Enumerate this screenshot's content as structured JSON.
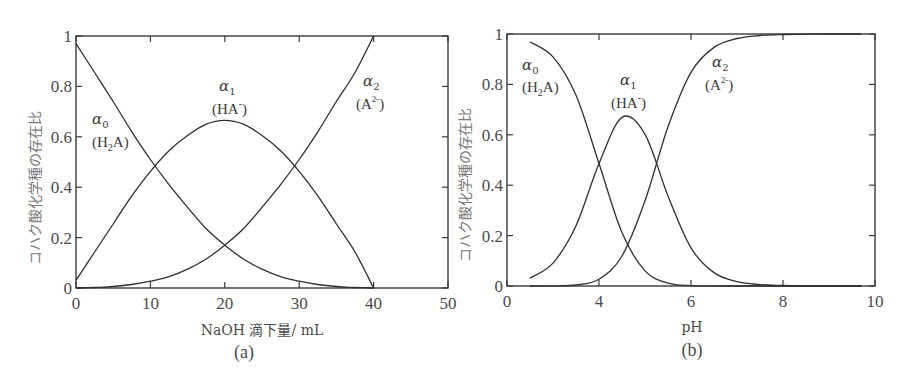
{
  "chart_data": [
    {
      "type": "line",
      "panel": "(a)",
      "title": "",
      "xlabel": "NaOH 滴下量/ mL",
      "ylabel": "コハク酸化学種の存在比",
      "caption": "(a)",
      "xlim": [
        0,
        50
      ],
      "ylim": [
        0,
        1
      ],
      "xticks": [
        0,
        10,
        20,
        30,
        40,
        50
      ],
      "yticks": [
        0,
        0.2,
        0.4,
        0.6,
        0.8,
        1
      ],
      "ytick_labels": [
        "0",
        "0.2",
        "0.4",
        "0.6",
        "0.8",
        "1"
      ],
      "grid": false,
      "x": [
        0,
        2.5,
        5,
        7.5,
        10,
        12.5,
        15,
        17.5,
        20,
        22.5,
        25,
        27.5,
        30,
        32.5,
        35,
        37.5,
        40
      ],
      "series": [
        {
          "name": "α0 (H2A)",
          "values": [
            0.97,
            0.855,
            0.74,
            0.62,
            0.51,
            0.41,
            0.32,
            0.235,
            0.17,
            0.115,
            0.075,
            0.045,
            0.027,
            0.014,
            0.006,
            0.002,
            0.0
          ]
        },
        {
          "name": "α1 (HA-)",
          "values": [
            0.03,
            0.143,
            0.254,
            0.366,
            0.463,
            0.545,
            0.605,
            0.65,
            0.665,
            0.65,
            0.605,
            0.545,
            0.463,
            0.366,
            0.254,
            0.143,
            0.0
          ]
        },
        {
          "name": "α2 (A2-)",
          "values": [
            0.0,
            0.002,
            0.006,
            0.014,
            0.027,
            0.045,
            0.075,
            0.115,
            0.17,
            0.235,
            0.32,
            0.41,
            0.51,
            0.62,
            0.74,
            0.855,
            1.0
          ]
        }
      ],
      "annotations": [
        {
          "greek": "α",
          "sub": "0",
          "species": "(H",
          "species_sub": "2",
          "species_end": "A)"
        },
        {
          "greek": "α",
          "sub": "1",
          "species": "(HA",
          "species_sup": "-",
          "species_end": ")"
        },
        {
          "greek": "α",
          "sub": "2",
          "species": "(A",
          "species_sup": "2-",
          "species_end": ")"
        }
      ]
    },
    {
      "type": "line",
      "panel": "(b)",
      "title": "",
      "xlabel": "pH",
      "ylabel": "コハク酸化学種の存在比",
      "caption": "(b)",
      "xlim": [
        2,
        10
      ],
      "ylim": [
        0,
        1
      ],
      "xticks": [
        2,
        4,
        6,
        8,
        10
      ],
      "xtick_labels": [
        "0",
        "4",
        "6",
        "8",
        "10"
      ],
      "yticks": [
        0,
        0.2,
        0.4,
        0.6,
        0.8,
        1
      ],
      "ytick_labels": [
        "0",
        "0.2",
        "0.4",
        "0.6",
        "0.8",
        "1"
      ],
      "grid": false,
      "x": [
        2.5,
        3,
        3.5,
        4,
        4.5,
        5,
        5.5,
        6,
        6.5,
        7,
        7.5,
        8,
        9,
        9.7
      ],
      "series": [
        {
          "name": "α0 (H2A)",
          "values": [
            0.969,
            0.909,
            0.757,
            0.486,
            0.212,
            0.06,
            0.011,
            0.0015,
            0.0002,
            0.0,
            0.0,
            0.0,
            0.0,
            0.0
          ]
        },
        {
          "name": "α1 (HA-)",
          "values": [
            0.031,
            0.091,
            0.239,
            0.486,
            0.669,
            0.602,
            0.357,
            0.151,
            0.053,
            0.0175,
            0.0056,
            0.0018,
            0.0002,
            0.0
          ]
        },
        {
          "name": "α2 (A2-)",
          "values": [
            0.0,
            0.0005,
            0.004,
            0.027,
            0.119,
            0.338,
            0.632,
            0.848,
            0.947,
            0.982,
            0.994,
            0.998,
            1.0,
            1.0
          ]
        }
      ],
      "annotations": [
        {
          "greek": "α",
          "sub": "0",
          "species": "(H",
          "species_sub": "2",
          "species_end": "A)"
        },
        {
          "greek": "α",
          "sub": "1",
          "species": "(HA",
          "species_sup": "-",
          "species_end": ")"
        },
        {
          "greek": "α",
          "sub": "2",
          "species": "(A",
          "species_sup": "2-",
          "species_end": ")"
        }
      ]
    }
  ]
}
